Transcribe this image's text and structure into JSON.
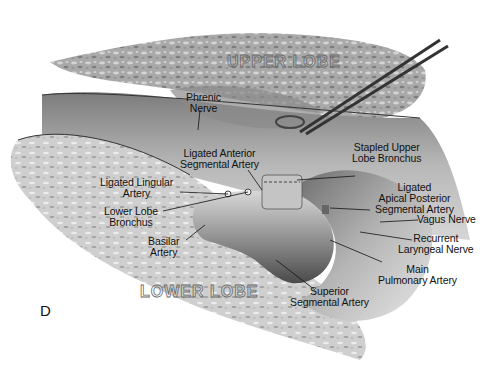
{
  "figure": {
    "panel_letter": "D",
    "colors": {
      "background": "#ffffff",
      "lung_tissue": "#a8a8a8",
      "lung_dark": "#6e6e6e",
      "vessel": "#8c8c8c",
      "vessel_highlight": "#d8d8d8",
      "label_text": "#111111",
      "leader_line": "#111111"
    },
    "regions": {
      "upper_lobe": "UPPER LOBE",
      "lower_lobe": "LOWER LOBE"
    },
    "labels": [
      {
        "id": "phrenic-nerve",
        "text": "Phrenic\nNerve"
      },
      {
        "id": "ligated-anterior-segmental-artery",
        "text": "Ligated Anterior\nSegmental Artery"
      },
      {
        "id": "stapled-upper-lobe-bronchus",
        "text": "Stapled Upper\nLobe Bronchus"
      },
      {
        "id": "ligated-lingular-artery",
        "text": "Ligated Lingular\nArtery"
      },
      {
        "id": "lower-lobe-bronchus",
        "text": "Lower Lobe\nBronchus"
      },
      {
        "id": "ligated-apical-posterior-segmental-artery",
        "text": "Ligated\nApical Posterior\nSegmental Artery"
      },
      {
        "id": "vagus-nerve",
        "text": "Vagus Nerve"
      },
      {
        "id": "basilar-artery",
        "text": "Basilar\nArtery"
      },
      {
        "id": "recurrent-laryngeal-nerve",
        "text": "Recurrent\nLaryngeal Nerve"
      },
      {
        "id": "main-pulmonary-artery",
        "text": "Main\nPulmonary Artery"
      },
      {
        "id": "superior-segmental-artery",
        "text": "Superior\nSegmental Artery"
      }
    ]
  }
}
